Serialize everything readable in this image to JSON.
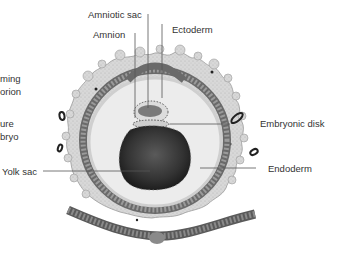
{
  "diagram": {
    "labels": {
      "amniotic_sac": "Amniotic sac",
      "amnion": "Amnion",
      "ectoderm": "Ectoderm",
      "forming_chorion_line1": "ming",
      "forming_chorion_line2": "orion",
      "future_embryo_line1": "ure",
      "future_embryo_line2": "bryo",
      "embryonic_disk": "Embryonic disk",
      "yolk_sac": "Yolk sac",
      "endoderm": "Endoderm"
    },
    "colors": {
      "outer_villi": "#d6d6d6",
      "cell_layer": "#6e6e6e",
      "cavity": "#eeeeee",
      "yolk": "#3a3a3a",
      "disk": "#7a7a7a",
      "leader_line": "#555555",
      "text": "#333333"
    }
  }
}
